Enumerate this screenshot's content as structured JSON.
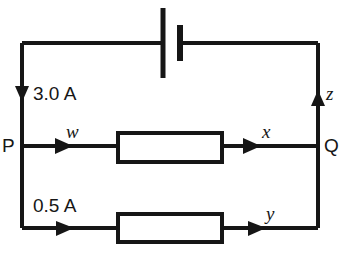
{
  "figure": {
    "kind": "circuit-diagram",
    "background_color": "#ffffff",
    "line_color": "#161616",
    "nodes": {
      "left_terminal_label": "P",
      "right_terminal_label": "Q"
    },
    "currents": {
      "top_branch_label": "3.0 A",
      "bottom_branch_label": "0.5 A"
    },
    "unknown_current_labels": {
      "middle_left": "w",
      "middle_right": "x",
      "bottom_right": "y",
      "right_vertical": "z"
    },
    "components": {
      "battery_name": "battery-symbol",
      "resistor_middle_name": "resistor-middle-branch",
      "resistor_bottom_name": "resistor-bottom-branch"
    }
  }
}
